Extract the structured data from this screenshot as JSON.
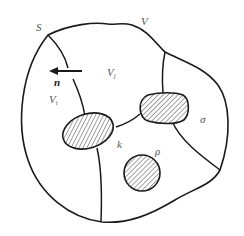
{
  "figure": {
    "type": "domain-decomposition-diagram",
    "colors": {
      "stroke": "#1a1a1a",
      "hatch": "#333333",
      "label": "#555555",
      "background": "#ffffff"
    },
    "labels": {
      "surface": "S",
      "volume": "V",
      "normal": "n",
      "subvolume_i": "V",
      "subvolume_i_sub": "i",
      "subvolume_j": "V",
      "subvolume_j_sub": "j",
      "sigma": "σ",
      "kappa": "k",
      "rho": "ρ"
    },
    "icons": {
      "normal_arrow": "arrow-left-icon",
      "hatched_inclusion": "hatched-region-icon"
    }
  }
}
